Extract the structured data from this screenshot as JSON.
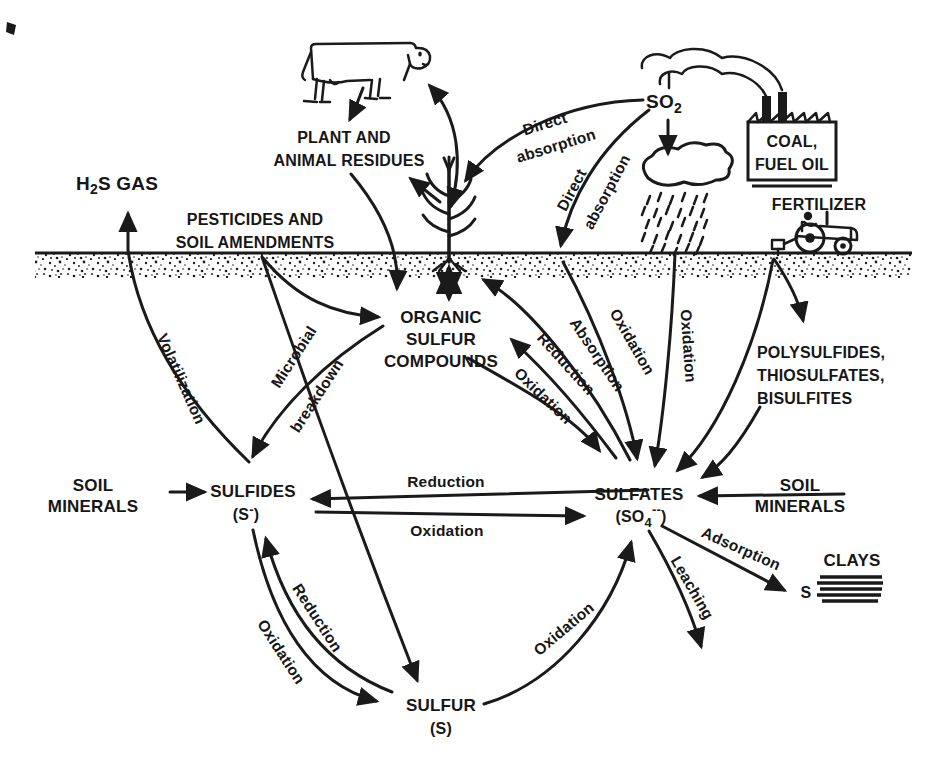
{
  "diagram": "sulfur-cycle",
  "colors": {
    "ink": "#1a1a1a",
    "paper": "#ffffff"
  },
  "nodes": {
    "h2s_gas": {
      "prefix": "H",
      "sub": "2",
      "suffix": "S GAS"
    },
    "plant_animal_residues": {
      "line1": "PLANT AND",
      "line2": "ANIMAL RESIDUES"
    },
    "pesticides_amendments": {
      "line1": "PESTICIDES AND",
      "line2": "SOIL AMENDMENTS"
    },
    "organic_sulfur_compounds": {
      "line1": "ORGANIC",
      "line2": "SULFUR",
      "line3": "COMPOUNDS"
    },
    "sulfides": {
      "name": "SULFIDES",
      "formula_pre": "(S",
      "formula_sup": "-",
      "formula_post": ")"
    },
    "sulfates": {
      "name": "SULFATES",
      "formula_pre": "(SO",
      "formula_sub": "4",
      "formula_sup": "--",
      "formula_post": ")"
    },
    "sulfur": {
      "name": "SULFUR",
      "formula": "(S)"
    },
    "soil_minerals_left": {
      "line1": "SOIL",
      "line2": "MINERALS"
    },
    "soil_minerals_right": {
      "line1": "SOIL",
      "line2": "MINERALS"
    },
    "polysulfides_group": {
      "line1": "POLYSULFIDES,",
      "line2": "THIOSULFATES,",
      "line3": "BISULFITES"
    },
    "fertilizer": {
      "label": "FERTILIZER"
    },
    "coal_fuel_oil": {
      "line1": "COAL,",
      "line2": "FUEL OIL"
    },
    "so2": {
      "base": "SO",
      "sub": "2"
    },
    "clays": {
      "label": "CLAYS",
      "adsorbed": "S"
    }
  },
  "flows": {
    "volatilization": "Volatilization",
    "microbial_breakdown": {
      "line1": "Microbial",
      "line2": "breakdown"
    },
    "reduction_sulfates_to_sulfides": "Reduction",
    "oxidation_sulfides_to_sulfates": "Oxidation",
    "reduction_sulfur_to_sulfides": "Reduction",
    "oxidation_sulfides_to_sulfur": "Oxidation",
    "oxidation_sulfur_to_sulfates": "Oxidation",
    "reduction_sulfates_to_organic": "Reduction",
    "oxidation_organic_to_sulfates": "Oxidation",
    "absorption": "Absorption",
    "oxidation_direct_entry": "Oxidation",
    "oxidation_rainfall": "Oxidation",
    "direct_absorption_plant": {
      "line1": "Direct",
      "line2": "absorption"
    },
    "direct_absorption_soil": {
      "line1": "Direct",
      "line2": "absorption"
    },
    "adsorption": "Adsorption",
    "leaching": "Leaching"
  }
}
